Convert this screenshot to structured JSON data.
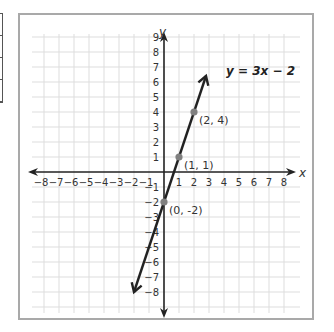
{
  "chart_data": {
    "type": "line",
    "title": "",
    "equation_label": "y = 3x − 2",
    "xlabel": "x",
    "ylabel": "y",
    "xlim": [
      -8,
      8
    ],
    "ylim": [
      -8,
      9
    ],
    "grid": true,
    "x_ticks": [
      "−8",
      "−7",
      "−6",
      "−5",
      "−4",
      "−3",
      "−2",
      "−1",
      "1",
      "2",
      "3",
      "4",
      "5",
      "6",
      "7",
      "8"
    ],
    "y_ticks": [
      "9",
      "8",
      "7",
      "6",
      "5",
      "4",
      "3",
      "2",
      "1",
      "−1",
      "−2",
      "−3",
      "−4",
      "−5",
      "−6",
      "−7",
      "−8"
    ],
    "series": [
      {
        "name": "y = 3x − 2",
        "slope": 3,
        "intercept": -2,
        "x": [
          -2.0,
          2.8
        ],
        "y": [
          -8.0,
          6.4
        ]
      }
    ],
    "points": [
      {
        "x": 0,
        "y": -2,
        "label": "(0, -2)"
      },
      {
        "x": 1,
        "y": 1,
        "label": "(1, 1)"
      },
      {
        "x": 2,
        "y": 4,
        "label": "(2, 4)"
      }
    ],
    "colors": {
      "line": "#222222",
      "point": "#808080",
      "grid": "#dddddd",
      "frame": "#a9a9a9"
    }
  }
}
